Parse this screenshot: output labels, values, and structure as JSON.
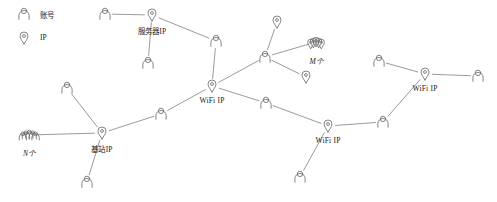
{
  "diagram": {
    "type": "network-graph",
    "title": "",
    "background_color": "#ffffff",
    "stroke_color": "#6e6e6e",
    "text_color": "#1a1a1a",
    "width": 497,
    "height": 202,
    "legend": {
      "items": [
        {
          "icon": "person-icon",
          "label": "账号",
          "x": 24,
          "y": 14
        },
        {
          "icon": "location-pin-icon",
          "label": "IP",
          "x": 24,
          "y": 38
        }
      ]
    },
    "nodes": [
      {
        "id": "p_server_left",
        "icon": "person-icon",
        "label": "",
        "x": 105,
        "y": 14
      },
      {
        "id": "server_ip",
        "icon": "location-pin-icon",
        "label": "服务器IP",
        "x": 152,
        "y": 15,
        "label_dx": 0,
        "label_dy": 10
      },
      {
        "id": "p_server_down",
        "icon": "person-icon",
        "label": "",
        "x": 148,
        "y": 63
      },
      {
        "id": "p_mid_top",
        "icon": "person-icon",
        "label": "",
        "x": 216,
        "y": 41
      },
      {
        "id": "wifi_ip_center",
        "icon": "location-pin-icon",
        "label": "WiFi IP",
        "x": 212,
        "y": 86,
        "label_dx": 0,
        "label_dy": 10
      },
      {
        "id": "p_hub_right",
        "icon": "person-icon",
        "label": "",
        "x": 265,
        "y": 57
      },
      {
        "id": "pin_top_right",
        "icon": "location-pin-icon",
        "label": "",
        "x": 277,
        "y": 22
      },
      {
        "id": "pin_cluster_m",
        "icon": "pin-cluster-icon",
        "label": "M个",
        "x": 316,
        "y": 42,
        "label_dx": 0,
        "label_dy": 13
      },
      {
        "id": "pin_low_right",
        "icon": "location-pin-icon",
        "label": "",
        "x": 306,
        "y": 77
      },
      {
        "id": "p_wifi2_top",
        "icon": "person-icon",
        "label": "",
        "x": 266,
        "y": 103
      },
      {
        "id": "wifi_ip_mid",
        "icon": "location-pin-icon",
        "label": "WiFi IP",
        "x": 328,
        "y": 126,
        "label_dx": 0,
        "label_dy": 10
      },
      {
        "id": "p_wifi2_down",
        "icon": "person-icon",
        "label": "",
        "x": 300,
        "y": 177
      },
      {
        "id": "p_wifi3_left",
        "icon": "person-icon",
        "label": "",
        "x": 383,
        "y": 122
      },
      {
        "id": "wifi_ip_right",
        "icon": "location-pin-icon",
        "label": "WiFi IP",
        "x": 425,
        "y": 74,
        "label_dx": 0,
        "label_dy": 10
      },
      {
        "id": "p_wifi3_top",
        "icon": "person-icon",
        "label": "",
        "x": 379,
        "y": 61
      },
      {
        "id": "p_far_right",
        "icon": "person-icon",
        "label": "",
        "x": 478,
        "y": 76
      },
      {
        "id": "p_bs_upleft",
        "icon": "person-icon",
        "label": "",
        "x": 67,
        "y": 88
      },
      {
        "id": "group_n",
        "icon": "person-group-icon",
        "label": "N个",
        "x": 29,
        "y": 135,
        "label_dx": 0,
        "label_dy": 12
      },
      {
        "id": "base_station_ip",
        "icon": "location-pin-icon",
        "label": "基站IP",
        "x": 102,
        "y": 133,
        "label_dx": 0,
        "label_dy": 10
      },
      {
        "id": "p_bs_down",
        "icon": "person-icon",
        "label": "",
        "x": 87,
        "y": 182
      },
      {
        "id": "p_bs_wifi",
        "icon": "person-icon",
        "label": "",
        "x": 161,
        "y": 114
      }
    ],
    "edges": [
      {
        "from": "p_server_left",
        "to": "server_ip"
      },
      {
        "from": "server_ip",
        "to": "p_server_down"
      },
      {
        "from": "server_ip",
        "to": "p_mid_top"
      },
      {
        "from": "p_mid_top",
        "to": "wifi_ip_center"
      },
      {
        "from": "wifi_ip_center",
        "to": "p_hub_right"
      },
      {
        "from": "p_hub_right",
        "to": "pin_top_right"
      },
      {
        "from": "p_hub_right",
        "to": "pin_cluster_m"
      },
      {
        "from": "p_hub_right",
        "to": "pin_low_right"
      },
      {
        "from": "wifi_ip_center",
        "to": "p_wifi2_top"
      },
      {
        "from": "p_wifi2_top",
        "to": "wifi_ip_mid"
      },
      {
        "from": "wifi_ip_mid",
        "to": "p_wifi2_down"
      },
      {
        "from": "wifi_ip_mid",
        "to": "p_wifi3_left"
      },
      {
        "from": "p_wifi3_left",
        "to": "wifi_ip_right"
      },
      {
        "from": "p_wifi3_top",
        "to": "wifi_ip_right"
      },
      {
        "from": "wifi_ip_right",
        "to": "p_far_right"
      },
      {
        "from": "wifi_ip_center",
        "to": "p_bs_wifi"
      },
      {
        "from": "p_bs_wifi",
        "to": "base_station_ip"
      },
      {
        "from": "base_station_ip",
        "to": "p_bs_upleft"
      },
      {
        "from": "base_station_ip",
        "to": "group_n"
      },
      {
        "from": "base_station_ip",
        "to": "p_bs_down"
      }
    ]
  }
}
